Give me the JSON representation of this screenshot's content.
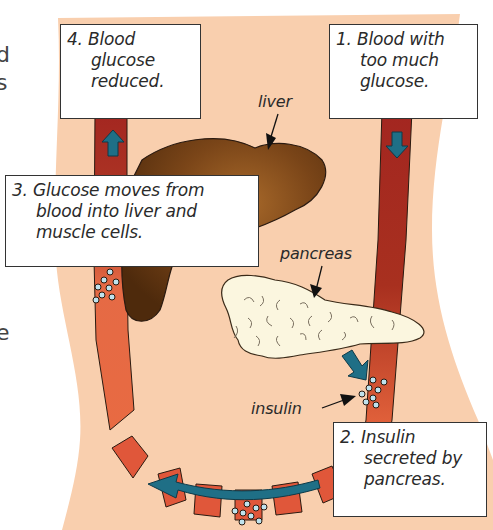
{
  "diagram": {
    "edge_fragments": {
      "top": "d",
      "middle": "s",
      "bottom": "e"
    },
    "callouts": [
      {
        "step": "1.",
        "lines": [
          "Blood with",
          "too much",
          "glucose."
        ]
      },
      {
        "step": "2.",
        "lines": [
          "Insulin",
          "secreted by",
          "pancreas."
        ]
      },
      {
        "step": "3.",
        "lines": [
          "Glucose moves from",
          "blood into liver and",
          "muscle cells."
        ]
      },
      {
        "step": "4.",
        "lines": [
          "Blood",
          "glucose",
          "reduced."
        ]
      }
    ],
    "labels": {
      "liver": "liver",
      "pancreas": "pancreas",
      "insulin": "insulin"
    },
    "colors": {
      "body_skin": "#f9cfae",
      "vessel_dark": "#a82a22",
      "vessel_light": "#e0603a",
      "arrow_teal": "#1f6f86",
      "liver_brown": "#6b3a14",
      "pancreas_cream": "#fbf6df",
      "glucose_dot": "#bfe3ee",
      "outline": "#2a1a10"
    }
  }
}
